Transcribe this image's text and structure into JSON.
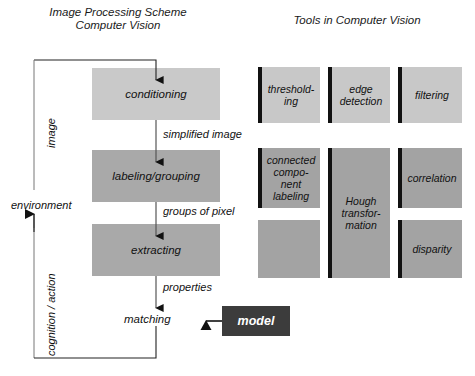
{
  "titles": {
    "left": "Image Processing Scheme\nComputer Vision",
    "right": "Tools in Computer Vision"
  },
  "pipeline": {
    "steps": [
      {
        "label": "conditioning",
        "shade": "light"
      },
      {
        "label": "labeling/grouping",
        "shade": "dark"
      },
      {
        "label": "extracting",
        "shade": "dark"
      }
    ],
    "terminal": "matching",
    "model": "model",
    "edge_labels": [
      "simplified image",
      "groups of pixel",
      "properties"
    ],
    "feedback_labels": {
      "top": "image",
      "middle": "environment",
      "bottom": "cognition / action"
    }
  },
  "tools": {
    "cells": [
      {
        "label": "threshold-\ning",
        "shade": "light",
        "bar": true
      },
      {
        "label": "edge\ndetection",
        "shade": "light",
        "bar": true
      },
      {
        "label": "filtering",
        "shade": "light",
        "bar": true
      },
      {
        "label": "connected\ncompo-\nnent\nlabeling",
        "shade": "dark",
        "bar": true
      },
      {
        "label": "Hough\ntransfor-\nmation",
        "shade": "dark",
        "bar": true
      },
      {
        "label": "correlation",
        "shade": "dark",
        "bar": true
      },
      {
        "label": "",
        "shade": "dark",
        "bar": false
      },
      {
        "label": "disparity",
        "shade": "dark",
        "bar": true
      }
    ]
  },
  "colors": {
    "light_gray": "#c9c9c9",
    "dark_gray": "#a9a9a9",
    "model_fill": "#3c3c3c",
    "bar": "#111111",
    "line": "#222222"
  }
}
